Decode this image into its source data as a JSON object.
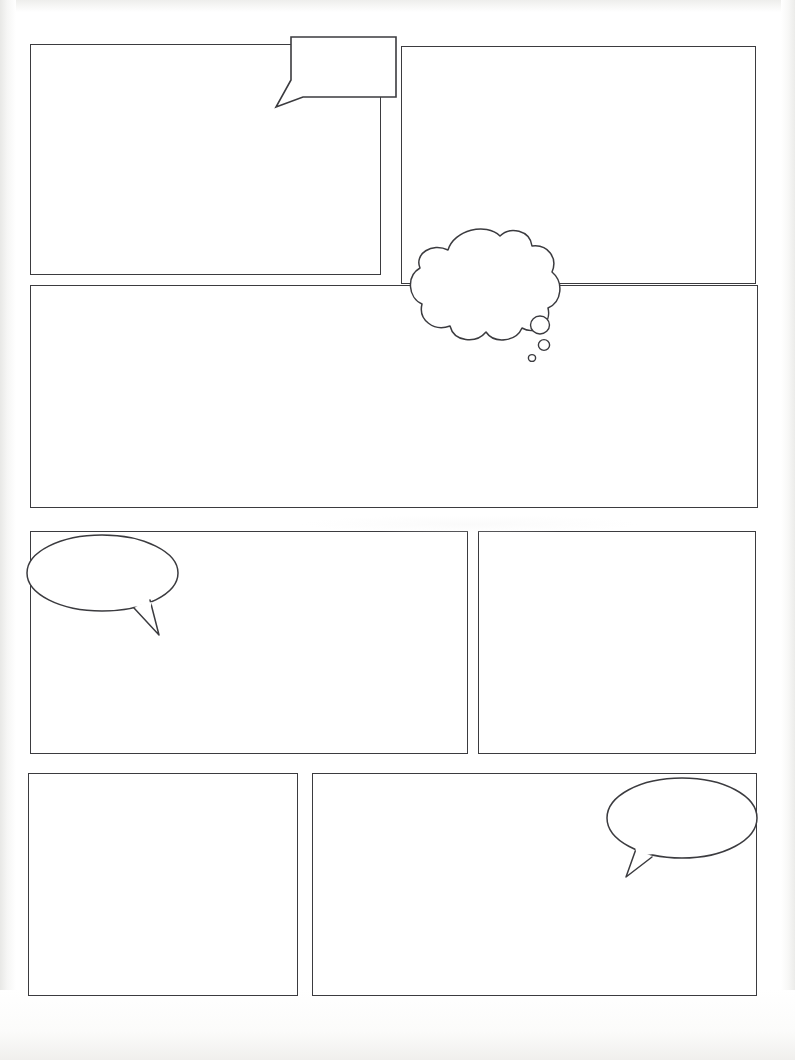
{
  "page": {
    "width": 795,
    "height": 1060,
    "background_color": "#ffffff",
    "ink_color": "#3b3b3f",
    "paper_note": "scanned white paper with light grey edge shading"
  },
  "panels": [
    {
      "id": "panel-1",
      "row": 1,
      "position": "top-left",
      "x": 30,
      "y": 44,
      "w": 351,
      "h": 231
    },
    {
      "id": "panel-2",
      "row": 1,
      "position": "top-right",
      "x": 401,
      "y": 46,
      "w": 355,
      "h": 238
    },
    {
      "id": "panel-3",
      "row": 2,
      "position": "full-width",
      "x": 30,
      "y": 285,
      "w": 728,
      "h": 223
    },
    {
      "id": "panel-4",
      "row": 3,
      "position": "middle-left",
      "x": 30,
      "y": 531,
      "w": 438,
      "h": 223
    },
    {
      "id": "panel-5",
      "row": 3,
      "position": "middle-right",
      "x": 478,
      "y": 531,
      "w": 278,
      "h": 223
    },
    {
      "id": "panel-6",
      "row": 4,
      "position": "bottom-left",
      "x": 28,
      "y": 773,
      "w": 270,
      "h": 223
    },
    {
      "id": "panel-7",
      "row": 4,
      "position": "bottom-right",
      "x": 312,
      "y": 773,
      "w": 445,
      "h": 223
    }
  ],
  "balloons": [
    {
      "id": "balloon-1",
      "type": "rectangular-speech-balloon",
      "tail_direction": "down-left",
      "overlaps": "panel-1 top border",
      "x": 276,
      "y": 36,
      "w": 106,
      "h": 61
    },
    {
      "id": "balloon-2",
      "type": "thought-cloud-balloon",
      "tail_direction": "down-right trailing circles",
      "trail_circles": 3,
      "overlaps": "panel-2 bottom-left corner and panel-3 top border",
      "x": 410,
      "y": 228,
      "w": 150,
      "h": 103
    },
    {
      "id": "balloon-3",
      "type": "oval-speech-balloon",
      "tail_direction": "down-right",
      "overlaps": "panel-4 top-left corner",
      "x": 26,
      "y": 534,
      "w": 152,
      "h": 78
    },
    {
      "id": "balloon-4",
      "type": "oval-speech-balloon",
      "tail_direction": "down-left",
      "overlaps": "panel-7 top-right corner",
      "x": 606,
      "y": 777,
      "w": 151,
      "h": 81
    }
  ]
}
